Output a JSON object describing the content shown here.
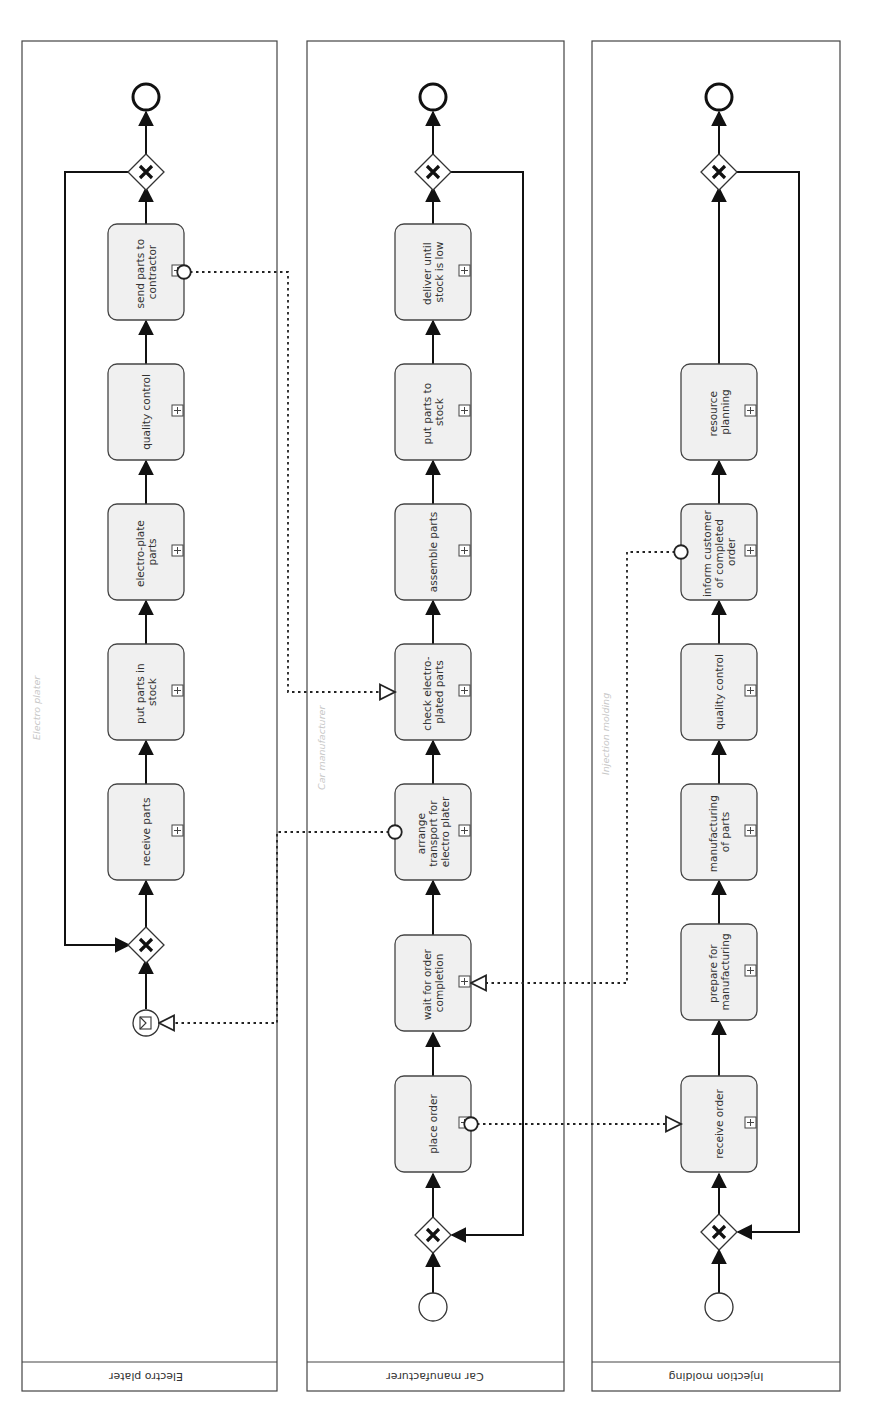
{
  "diagram": {
    "type": "BPMN collaboration",
    "orientation": "rotated 90° counter-clockwise (flow runs bottom to top)",
    "colors": {
      "task_fill": "#f0f0f0",
      "stroke": "#333333",
      "background": "#ffffff",
      "watermark": "#c8c8c8"
    }
  },
  "pools": [
    {
      "id": "electro",
      "label": "Electro plater",
      "watermark": "Electro plater",
      "start_event": "message start event",
      "tasks": [
        {
          "label_lines": [
            "send parts to",
            "contractor"
          ]
        },
        {
          "label_lines": [
            "quality control"
          ]
        },
        {
          "label_lines": [
            "electro-plate",
            "parts"
          ]
        },
        {
          "label_lines": [
            "put parts in",
            "stock"
          ]
        },
        {
          "label_lines": [
            "receive parts"
          ]
        }
      ],
      "gateways": [
        "exclusive gateway (merge)",
        "exclusive gateway (split)"
      ],
      "end_event": "end event"
    },
    {
      "id": "car",
      "label": "Car manufacturer",
      "watermark": "Car manufacturer",
      "start_event": "start event",
      "tasks": [
        {
          "label_lines": [
            "deliver until",
            "stock is low"
          ]
        },
        {
          "label_lines": [
            "put parts to",
            "stock"
          ]
        },
        {
          "label_lines": [
            "assemble parts"
          ]
        },
        {
          "label_lines": [
            "check electro-",
            "plated parts"
          ]
        },
        {
          "label_lines": [
            "arrange",
            "transport for",
            "electro plater"
          ]
        },
        {
          "label_lines": [
            "wait for order",
            "completion"
          ]
        },
        {
          "label_lines": [
            "place order"
          ]
        }
      ],
      "gateways": [
        "exclusive gateway (merge)",
        "exclusive gateway (split)"
      ],
      "end_event": "end event"
    },
    {
      "id": "injection",
      "label": "Injection molding",
      "watermark": "Injection molding",
      "start_event": "start event",
      "tasks": [
        {
          "label_lines": [
            "resource",
            "planning"
          ]
        },
        {
          "label_lines": [
            "inform customer",
            "of completed",
            "order"
          ]
        },
        {
          "label_lines": [
            "quality control"
          ]
        },
        {
          "label_lines": [
            "manufacturing",
            "of parts"
          ]
        },
        {
          "label_lines": [
            "prepare for",
            "manufacturing"
          ]
        },
        {
          "label_lines": [
            "receive order"
          ]
        }
      ],
      "gateways": [
        "exclusive gateway (merge)",
        "exclusive gateway (split)"
      ],
      "end_event": "end event"
    }
  ],
  "message_flows": [
    {
      "from": "place order",
      "to": "receive order"
    },
    {
      "from": "inform customer of completed order",
      "to": "wait for order completion"
    },
    {
      "from": "arrange transport for electro plater",
      "to": "Electro plater message start event"
    },
    {
      "from": "send parts to contractor",
      "to": "check electro-plated parts"
    }
  ]
}
